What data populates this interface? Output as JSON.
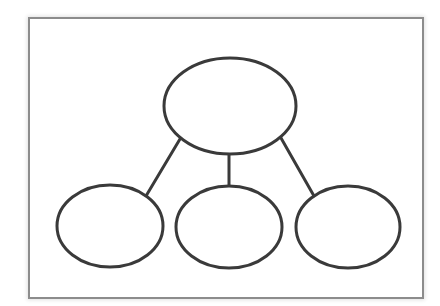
{
  "diagram": {
    "type": "hierarchy-graphic-organizer",
    "title": "",
    "frame": {
      "border_color": "#8c8c8c",
      "background": "#ffffff"
    },
    "stroke_color": "#3a3a3a",
    "stroke_width": 3,
    "nodes": [
      {
        "id": "top",
        "label": "",
        "level": 0,
        "cx": 230,
        "cy": 106,
        "rx": 66,
        "ry": 48
      },
      {
        "id": "bottom-left",
        "label": "",
        "level": 1,
        "cx": 110,
        "cy": 226,
        "rx": 53,
        "ry": 41
      },
      {
        "id": "bottom-middle",
        "label": "",
        "level": 1,
        "cx": 229,
        "cy": 227,
        "rx": 53,
        "ry": 41
      },
      {
        "id": "bottom-right",
        "label": "",
        "level": 1,
        "cx": 348,
        "cy": 227,
        "rx": 52,
        "ry": 41
      }
    ],
    "edges": [
      {
        "from": "top",
        "to": "bottom-left",
        "x1": 180,
        "y1": 139,
        "x2": 146,
        "y2": 196
      },
      {
        "from": "top",
        "to": "bottom-middle",
        "x1": 229,
        "y1": 154,
        "x2": 229,
        "y2": 186
      },
      {
        "from": "top",
        "to": "bottom-right",
        "x1": 281,
        "y1": 138,
        "x2": 314,
        "y2": 196
      }
    ]
  }
}
